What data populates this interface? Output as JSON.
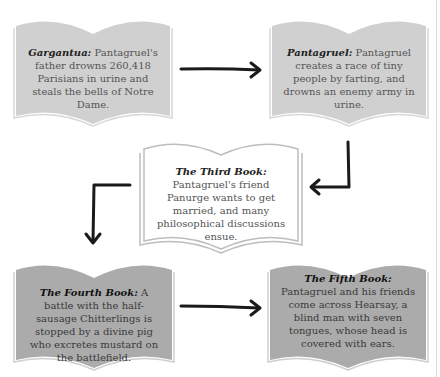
{
  "diagram": {
    "colors": {
      "book_light": "#cfcfcf",
      "book_dark": "#ababab",
      "book_outline": "#bdbdbd",
      "arrow": "#1a1a1a",
      "text": "#555555"
    },
    "books": [
      {
        "id": "gargantua",
        "title": "Gargantua:",
        "body": " Pantagruel's father drowns 260,418 Parisians in urine and steals the bells of Notre Dame."
      },
      {
        "id": "pantagruel",
        "title": "Pantagruel:",
        "body": " Pantagruel creates a race of tiny people by farting, and drowns an enemy army in urine."
      },
      {
        "id": "third-book",
        "title": "The Third Book:",
        "body": "Pantagruel's friend Panurge wants to get married, and many philosophical discussions ensue."
      },
      {
        "id": "fourth-book",
        "title": "The Fourth Book:",
        "body": " A battle with the half-sausage Chitterlings is stopped by a divine pig who excretes mustard on the battlefield."
      },
      {
        "id": "fifth-book",
        "title": "The Fifth Book:",
        "body": "Pantagruel and his friends come across Hearsay, a blind man with seven tongues, whose head is covered with ears."
      }
    ],
    "arrows": [
      {
        "from": "gargantua",
        "to": "pantagruel",
        "direction": "right"
      },
      {
        "from": "pantagruel",
        "to": "third-book",
        "direction": "down-then-left"
      },
      {
        "from": "third-book",
        "to": "fourth-book",
        "direction": "left-then-down"
      },
      {
        "from": "fourth-book",
        "to": "fifth-book",
        "direction": "right"
      }
    ]
  }
}
